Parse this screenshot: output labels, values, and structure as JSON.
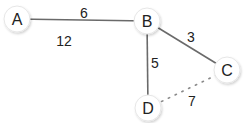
{
  "diagram": {
    "type": "weighted-graph",
    "nodes": [
      {
        "id": "A",
        "label": "A",
        "x": 17,
        "y": 19
      },
      {
        "id": "B",
        "label": "B",
        "x": 147,
        "y": 21
      },
      {
        "id": "C",
        "label": "C",
        "x": 227,
        "y": 70
      },
      {
        "id": "D",
        "label": "D",
        "x": 148,
        "y": 108
      }
    ],
    "edges": [
      {
        "from": "A",
        "to": "B",
        "weight": "6",
        "style": "solid",
        "label_x": 84,
        "label_y": 13
      },
      {
        "from": "B",
        "to": "C",
        "weight": "3",
        "style": "solid",
        "label_x": 191,
        "label_y": 37
      },
      {
        "from": "B",
        "to": "D",
        "weight": "5",
        "style": "solid",
        "label_x": 155,
        "label_y": 63
      },
      {
        "from": "D",
        "to": "C",
        "weight": "7",
        "style": "dotted",
        "label_x": 192,
        "label_y": 101
      }
    ],
    "floating_labels": [
      {
        "text": "12",
        "x": 64,
        "y": 41
      }
    ]
  }
}
